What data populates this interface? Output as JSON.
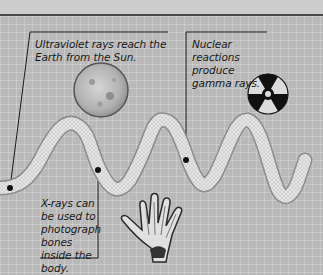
{
  "captions": {
    "ultraviolet": "Ultraviolet rays reach the Earth from the Sun.",
    "gamma": "Nuclear reactions produce gamma rays.",
    "xray": "X-rays can be used to photograph bones inside the body."
  },
  "illustrations": {
    "sun": "sun-icon",
    "radiation": "radiation-symbol-icon",
    "hand": "xray-hand-icon",
    "wave": "electromagnetic-wave"
  },
  "colors": {
    "background": "#b9b9b9",
    "top_strip": "#cdcdcd",
    "line": "#1a1a1a",
    "wave_fill": "#e2e2e2"
  }
}
